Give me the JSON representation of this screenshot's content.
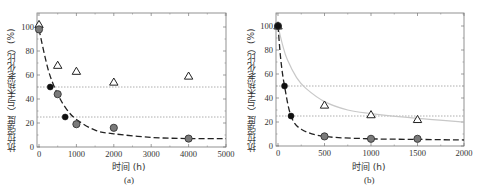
{
  "chart_data": [
    {
      "id": "a",
      "type": "scatter",
      "caption": "(a)",
      "xlabel": "时间 (h)",
      "ylabel": "抗拉强度（与未热老化比）(%)",
      "xlim": [
        0,
        5000
      ],
      "ylim": [
        0,
        110
      ],
      "xticks": [
        0,
        1000,
        2000,
        3000,
        4000,
        5000
      ],
      "yticks": [
        0,
        20,
        40,
        60,
        80,
        100
      ],
      "reference_lines": [
        50,
        25
      ],
      "series": [
        {
          "name": "triangles",
          "marker": "open-triangle",
          "x": [
            0,
            500,
            1000,
            2000,
            4000
          ],
          "y": [
            102,
            68,
            63,
            54,
            59
          ]
        },
        {
          "name": "gray-circles",
          "marker": "gray-circle",
          "x": [
            0,
            500,
            1000,
            2000,
            4000
          ],
          "y": [
            98,
            44,
            19,
            16,
            7
          ]
        },
        {
          "name": "black-circles",
          "marker": "black-circle",
          "x": [
            300,
            700
          ],
          "y": [
            50,
            25
          ]
        },
        {
          "name": "fit-dashed",
          "style": "black-dashed",
          "x": [
            0,
            250,
            500,
            750,
            1000,
            1500,
            2000,
            3000,
            4000,
            5000
          ],
          "y": [
            98,
            64,
            44,
            31,
            23,
            14,
            11,
            8,
            7,
            7
          ]
        }
      ]
    },
    {
      "id": "b",
      "type": "scatter",
      "caption": "(b)",
      "xlabel": "时间 (h)",
      "ylabel": "抗拉强度（与未热老化比）(%)",
      "xlim": [
        0,
        2000
      ],
      "ylim": [
        0,
        110
      ],
      "xticks": [
        0,
        500,
        1000,
        1500,
        2000
      ],
      "yticks": [
        0,
        20,
        40,
        60,
        80,
        100
      ],
      "reference_lines": [
        50,
        25
      ],
      "series": [
        {
          "name": "triangles",
          "marker": "open-triangle",
          "x": [
            0,
            500,
            1000,
            1500
          ],
          "y": [
            100,
            34,
            26,
            22
          ]
        },
        {
          "name": "gray-circles",
          "marker": "gray-circle",
          "x": [
            0,
            500,
            1000,
            1500
          ],
          "y": [
            100,
            8,
            6,
            6
          ]
        },
        {
          "name": "black-circles",
          "marker": "black-circle",
          "x": [
            0,
            70,
            140
          ],
          "y": [
            100,
            50,
            25
          ]
        },
        {
          "name": "fit-solid-gray",
          "style": "light-gray-solid",
          "x": [
            0,
            50,
            100,
            200,
            300,
            500,
            750,
            1000,
            1500,
            2000
          ],
          "y": [
            100,
            84,
            72,
            57,
            48,
            37,
            30,
            27,
            23,
            20
          ]
        },
        {
          "name": "fit-dashed",
          "style": "black-dashed",
          "x": [
            0,
            30,
            70,
            140,
            250,
            500,
            1000,
            1500,
            2000
          ],
          "y": [
            100,
            72,
            50,
            25,
            14,
            8,
            6,
            5.5,
            5
          ]
        }
      ]
    }
  ]
}
